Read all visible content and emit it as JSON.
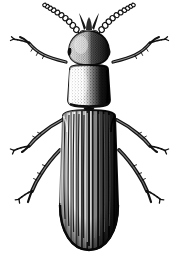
{
  "figure": {
    "title": "Beetle dorsal view engraving",
    "subject": "beetle",
    "view": "dorsal",
    "technique": "stipple-and-line engraving",
    "caption": "",
    "width_px": 177,
    "height_px": 261,
    "background_color": "#ffffff",
    "ink_color": "#0d0d0d",
    "midtone_color": "#6e6e6e",
    "highlight_color": "#f2f2f2",
    "lighting": "light from upper-left, shadow on right side"
  },
  "anatomy": {
    "antennae": {
      "name": "antennae",
      "count": 2,
      "type": "moniliform-beaded",
      "segments_per_antenna": 10,
      "description": "beaded segmented antennae splayed forward-outward from head"
    },
    "mouthparts": {
      "name": "mandibles-and-palps",
      "description": "dark mandibles and short palps at front of head"
    },
    "head": {
      "name": "head",
      "shape": "oval",
      "description": "rounded head with stippled left highlight and solid black right shadow"
    },
    "eyes": {
      "name": "compound-eyes",
      "count": 2,
      "description": "small lateral eyes at head margins"
    },
    "pronotum": {
      "name": "pronotum",
      "shape": "rounded-rectangle",
      "description": "broad thoracic shield, stippled light on left, black on right"
    },
    "scutellum": {
      "name": "scutellum",
      "shape": "small-triangle",
      "description": "small plate between elytra bases"
    },
    "elytra": {
      "name": "elytra",
      "count": 2,
      "striae_per_elytron": 11,
      "apex": "rounded",
      "description": "long parallel-sided wing covers with deep longitudinal striae, rounded apex"
    },
    "legs": {
      "name": "legs",
      "count": 6,
      "pairs": [
        {
          "name": "foreleg-pair",
          "label": "prothoracic legs"
        },
        {
          "name": "midleg-pair",
          "label": "mesothoracic legs"
        },
        {
          "name": "hindleg-pair",
          "label": "metathoracic legs"
        }
      ],
      "segments": [
        "femur",
        "tibia",
        "tarsus",
        "claws"
      ],
      "description": "slender legs with spiny tibiae and multi-segmented tarsi ending in claws"
    }
  }
}
